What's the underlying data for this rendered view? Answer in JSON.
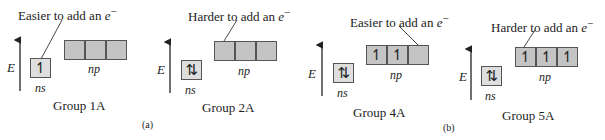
{
  "panels": [
    {
      "id": "group-1a",
      "group_label": "Group 1A",
      "annotation": "Easier to add an",
      "annotation_symbol": "e",
      "annotation_sup": "−",
      "axis_label": "E",
      "ns_label": "ns",
      "np_label": "np",
      "ns_electrons": "↿",
      "np_electrons": [
        "",
        "",
        ""
      ],
      "annotation_points_to": "ns"
    },
    {
      "id": "group-2a",
      "group_label": "Group 2A",
      "annotation": "Harder to add an",
      "annotation_symbol": "e",
      "annotation_sup": "−",
      "axis_label": "E",
      "ns_label": "ns",
      "np_label": "np",
      "ns_electrons": "⇅",
      "np_electrons": [
        "",
        "",
        ""
      ],
      "annotation_points_to": "np[0]"
    },
    {
      "id": "group-4a",
      "group_label": "Group 4A",
      "annotation": "Easier to add an",
      "annotation_symbol": "e",
      "annotation_sup": "−",
      "axis_label": "E",
      "ns_label": "ns",
      "np_label": "np",
      "ns_electrons": "⇅",
      "np_electrons": [
        "↿",
        "↿",
        ""
      ],
      "annotation_points_to": "np[2]"
    },
    {
      "id": "group-5a",
      "group_label": "Group 5A",
      "annotation": "Harder to add an",
      "annotation_symbol": "e",
      "annotation_sup": "−",
      "axis_label": "E",
      "ns_label": "ns",
      "np_label": "np",
      "ns_electrons": "⇅",
      "np_electrons": [
        "↿",
        "↿",
        "↿"
      ],
      "annotation_points_to": "np[0]"
    }
  ],
  "subfigure_labels": {
    "a": "(a)",
    "b": "(b)"
  },
  "colors": {
    "ns_fill": "#dedede",
    "np_fill": "#c4c4c4",
    "border": "#555555",
    "text": "#222222"
  }
}
